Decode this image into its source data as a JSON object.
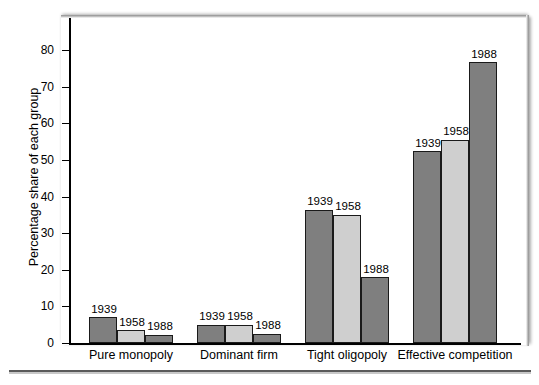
{
  "chart_data": {
    "type": "bar",
    "title": "",
    "xlabel": "",
    "ylabel": "Percentage share of each group",
    "ylim": [
      0,
      85
    ],
    "yticks": [
      0,
      10,
      20,
      30,
      40,
      50,
      60,
      70,
      80
    ],
    "ytick_labels": [
      "0",
      "10",
      "20",
      "30",
      "40",
      "50",
      "60",
      "70",
      "80"
    ],
    "grid": false,
    "legend": "none",
    "categories": [
      "Pure monopoly",
      "Dominant firm",
      "Tight oligopoly",
      "Effective competition"
    ],
    "series": [
      {
        "name": "1939",
        "color": "#7f7f7f",
        "values": [
          7.0,
          5.0,
          36.4,
          52.4
        ]
      },
      {
        "name": "1958",
        "color": "#cfcfcf",
        "values": [
          3.5,
          5.0,
          35.0,
          55.6
        ]
      },
      {
        "name": "1988",
        "color": "#7f7f7f",
        "values": [
          2.2,
          2.5,
          18.0,
          76.7
        ]
      }
    ],
    "bar_labels": [
      [
        "1939",
        "1958",
        "1988"
      ],
      [
        "1939",
        "1958",
        "1988"
      ],
      [
        "1939",
        "1958",
        "1988"
      ],
      [
        "1939",
        "1958",
        "1988"
      ]
    ],
    "colors": {
      "dark_bar": "#7f7f7f",
      "light_bar": "#cfcfcf",
      "bar_outline": "#1a1a1a",
      "axis": "#000000",
      "text": "#000000",
      "background": "#ffffff"
    }
  }
}
